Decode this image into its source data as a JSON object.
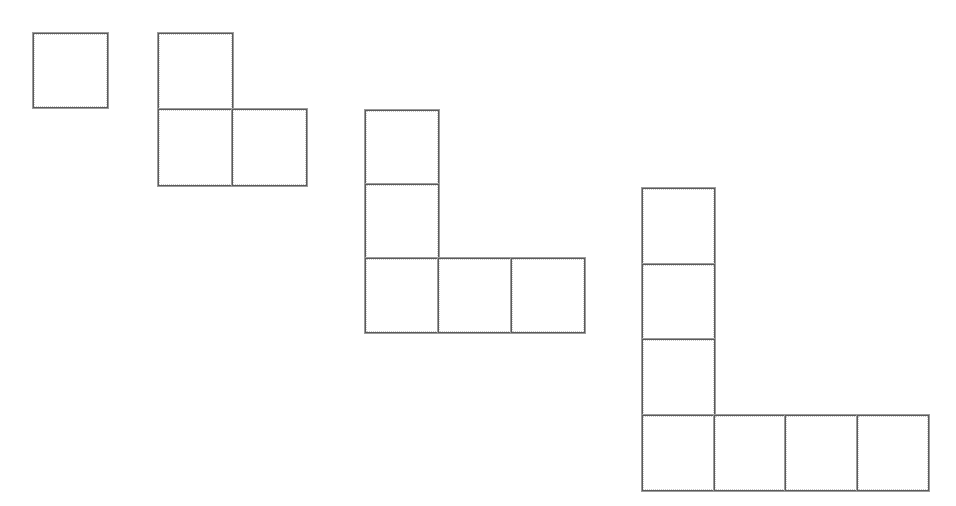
{
  "canvas": {
    "width": 956,
    "height": 506,
    "background": "#ffffff",
    "title": "Growing L-shaped square tile pattern"
  },
  "style": {
    "line_color": "#5a5a5a",
    "line_outer_color": "#9a9a9a",
    "line_inner_dotted_color": "#c8c8c8",
    "fill_color": "#ffffff",
    "line_width": 1
  },
  "figures": [
    {
      "name": "figure-1",
      "label": "Figure 1",
      "square_count": 1,
      "origin_x": 33,
      "origin_y": 33,
      "cell_width": 74,
      "cell_height": 74,
      "arm_length": 1,
      "cells": [
        {
          "col": 0,
          "row": 0
        }
      ]
    },
    {
      "name": "figure-2",
      "label": "Figure 2",
      "square_count": 3,
      "origin_x": 158,
      "origin_y": 33,
      "cell_width": 74,
      "cell_height": 76,
      "arm_length": 2,
      "cells": [
        {
          "col": 0,
          "row": 0
        },
        {
          "col": 0,
          "row": 1
        },
        {
          "col": 1,
          "row": 1
        }
      ]
    },
    {
      "name": "figure-3",
      "label": "Figure 3",
      "square_count": 5,
      "origin_x": 365,
      "origin_y": 110,
      "cell_width": 73,
      "cell_height": 74,
      "arm_length": 3,
      "cells": [
        {
          "col": 0,
          "row": 0
        },
        {
          "col": 0,
          "row": 1
        },
        {
          "col": 0,
          "row": 2
        },
        {
          "col": 1,
          "row": 2
        },
        {
          "col": 2,
          "row": 2
        }
      ]
    },
    {
      "name": "figure-4",
      "label": "Figure 4",
      "square_count": 7,
      "origin_x": 642,
      "origin_y": 188,
      "cell_width": 71.5,
      "cell_height": 75.5,
      "arm_length": 4,
      "cells": [
        {
          "col": 0,
          "row": 0
        },
        {
          "col": 0,
          "row": 1
        },
        {
          "col": 0,
          "row": 2
        },
        {
          "col": 0,
          "row": 3
        },
        {
          "col": 1,
          "row": 3
        },
        {
          "col": 2,
          "row": 3
        },
        {
          "col": 3,
          "row": 3
        }
      ]
    }
  ]
}
